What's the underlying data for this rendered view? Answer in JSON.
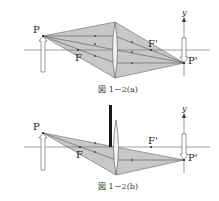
{
  "colors": {
    "shade": "#c8c8c8",
    "line": "#555555",
    "axis": "#777777",
    "bar": "#1a1a1a",
    "text": "#222222"
  },
  "figure_a": {
    "caption": "図 1－2(a)",
    "labels": {
      "object_point": "P",
      "focal_front": "F",
      "focal_back": "F'",
      "image_point": "P'",
      "axis_y": "y"
    },
    "geometry": {
      "axis_y": 50,
      "axis_x0": 24,
      "axis_x1": 210,
      "P": [
        43,
        36
      ],
      "Pp": [
        184,
        63
      ],
      "F": [
        78,
        50
      ],
      "Fp": [
        151,
        50
      ],
      "lens_x": 115,
      "lens_top": 22,
      "lens_bottom": 78,
      "object_arrow": {
        "x": 43,
        "tip": 36,
        "base": 72
      },
      "image_axis": {
        "x": 184,
        "top": 17,
        "bottom": 76
      },
      "image_arrow": {
        "x": 184,
        "from": 38,
        "tip": 63
      },
      "caption_y": 92
    }
  },
  "figure_b": {
    "caption": "図 1－2(b)",
    "labels": {
      "object_point": "P",
      "focal_front": "F",
      "focal_back": "F'",
      "image_point": "P'",
      "axis_y": "y"
    },
    "geometry": {
      "axis_y": 147,
      "axis_x0": 24,
      "axis_x1": 210,
      "P": [
        43,
        133
      ],
      "Pp": [
        184,
        160
      ],
      "F": [
        80,
        147
      ],
      "Fp": [
        151,
        147
      ],
      "lens_x": 116,
      "lens_top": 120,
      "lens_bottom": 175,
      "stop_bar": {
        "x": 109,
        "width": 3,
        "top": 105,
        "bottom": 147
      },
      "object_arrow": {
        "x": 43,
        "tip": 133,
        "base": 170
      },
      "image_axis": {
        "x": 184,
        "top": 113,
        "bottom": 173
      },
      "image_arrow": {
        "x": 184,
        "from": 134,
        "tip": 160
      },
      "caption_y": 189
    }
  }
}
